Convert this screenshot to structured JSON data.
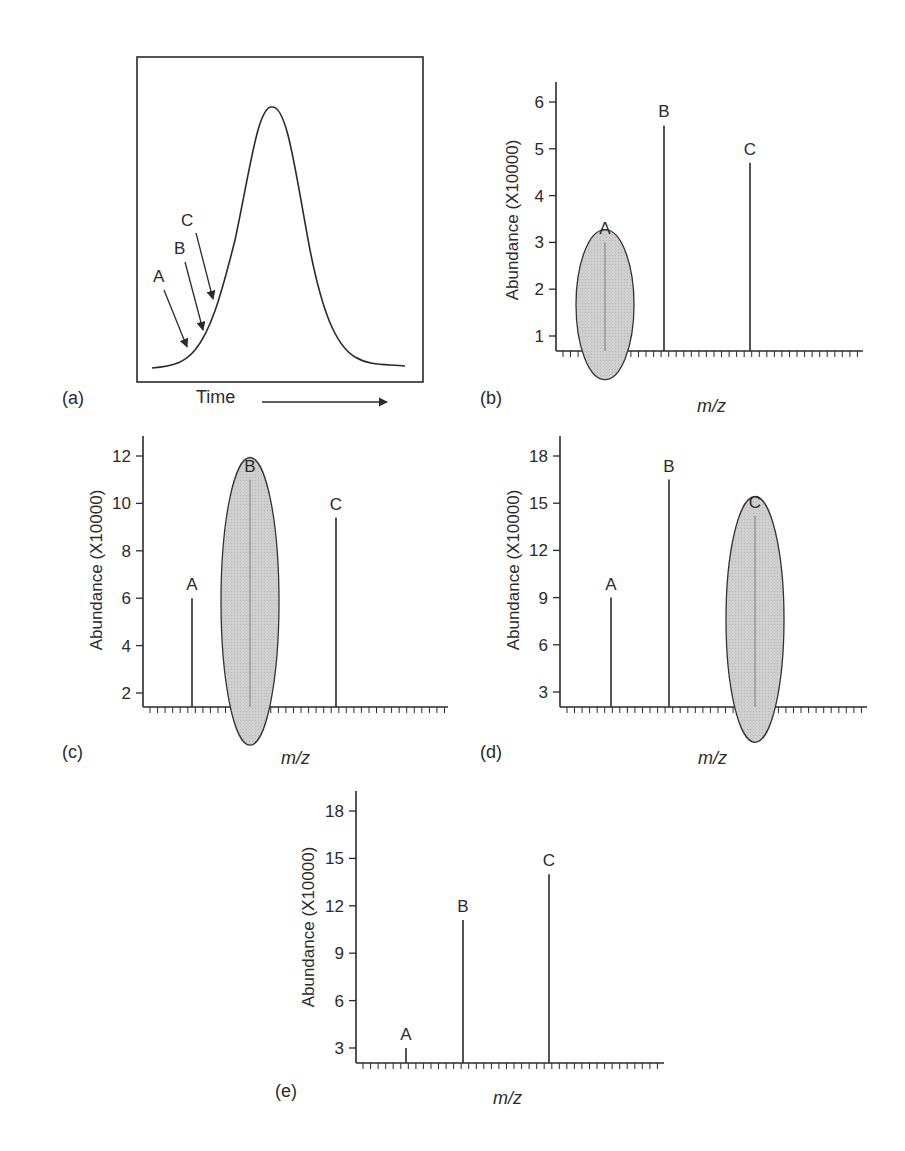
{
  "figure": {
    "panel_a": {
      "label": "(a)",
      "xlabel": "Time",
      "arrow_labels": [
        "A",
        "B",
        "C"
      ]
    },
    "panel_b": {
      "label": "(b)",
      "ylabel": "Abundance (X10000)",
      "xlabel": "m/z"
    },
    "panel_c": {
      "label": "(c)",
      "ylabel": "Abundance (X10000)",
      "xlabel": "m/z"
    },
    "panel_d": {
      "label": "(d)",
      "ylabel": "Abundance (X10000)",
      "xlabel": "m/z"
    },
    "panel_e": {
      "label": "(e)",
      "ylabel": "Abundance (X10000)",
      "xlabel": "m/z"
    }
  },
  "colors": {
    "ink": "#2a2a2a",
    "highlight_fill": "#c8c8c8",
    "highlight_stroke": "#333333"
  },
  "chart_data": [
    {
      "panel": "(a)",
      "type": "line",
      "title": "",
      "xlabel": "Time",
      "ylabel": "",
      "description": "Gaussian chromatographic peak; arrows A, B, C mark successive points on the leading edge",
      "annotations": [
        {
          "text": "A",
          "position": "early leading edge (lowest)"
        },
        {
          "text": "B",
          "position": "leading edge (middle)"
        },
        {
          "text": "C",
          "position": "leading edge (highest)"
        }
      ]
    },
    {
      "panel": "(b)",
      "type": "bar",
      "title": "",
      "xlabel": "m/z",
      "ylabel": "Abundance (X10000)",
      "categories": [
        "A",
        "B",
        "C"
      ],
      "values": [
        3.0,
        5.5,
        4.7
      ],
      "yticks": [
        1,
        2,
        3,
        4,
        5,
        6
      ],
      "ylim": [
        0.7,
        6.4
      ],
      "highlighted": "A"
    },
    {
      "panel": "(c)",
      "type": "bar",
      "title": "",
      "xlabel": "m/z",
      "ylabel": "Abundance (X10000)",
      "categories": [
        "A",
        "B",
        "C"
      ],
      "values": [
        6.0,
        11.0,
        9.4
      ],
      "yticks": [
        2,
        4,
        6,
        8,
        10,
        12
      ],
      "ylim": [
        1.4,
        12.8
      ],
      "highlighted": "B"
    },
    {
      "panel": "(d)",
      "type": "bar",
      "title": "",
      "xlabel": "m/z",
      "ylabel": "Abundance (X10000)",
      "categories": [
        "A",
        "B",
        "C"
      ],
      "values": [
        9.0,
        16.5,
        14.2
      ],
      "yticks": [
        3,
        6,
        9,
        12,
        15,
        18
      ],
      "ylim": [
        2.1,
        19.2
      ],
      "highlighted": "C"
    },
    {
      "panel": "(e)",
      "type": "bar",
      "title": "",
      "xlabel": "m/z",
      "ylabel": "Abundance (X10000)",
      "categories": [
        "A",
        "B",
        "C"
      ],
      "values": [
        3.0,
        11.1,
        14.0
      ],
      "yticks": [
        3,
        6,
        9,
        12,
        15,
        18
      ],
      "ylim": [
        2.1,
        19.2
      ],
      "highlighted": null
    }
  ]
}
